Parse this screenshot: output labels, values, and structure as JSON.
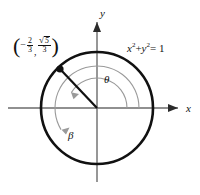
{
  "figure": {
    "background": "#ffffff",
    "axis_color": "#6b6b6b",
    "circle_color": "#111111",
    "arc_color": "#9a9a9a",
    "point_color": "#111111"
  },
  "axes": {
    "x_label": "x",
    "y_label": "y",
    "origin": {
      "x": 97,
      "y": 108
    }
  },
  "circle": {
    "equation": "x",
    "equation_plus": "+",
    "equation_y": "y",
    "equation_equals": "= 1",
    "exponent": "2",
    "radius_px": 56,
    "center_x": 97,
    "center_y": 108
  },
  "point": {
    "label_open": "(",
    "label_close": ")",
    "x_sign": "−",
    "x_num": "2",
    "x_den": "3",
    "comma": ",",
    "radical": "√",
    "y_num": "5",
    "y_den": "3",
    "coord_x": 60,
    "coord_y": 69
  },
  "angles": {
    "theta": {
      "label": "θ",
      "arc_radius_px": 30,
      "start_deg": 0,
      "end_deg": 149
    },
    "beta": {
      "label": "β",
      "arc_radius_px": 42,
      "start_deg": 0,
      "end_deg": -211
    }
  }
}
